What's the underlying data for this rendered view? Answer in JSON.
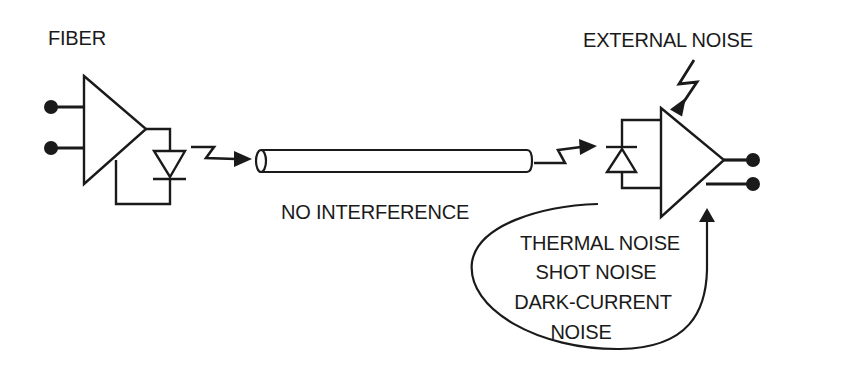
{
  "diagram": {
    "type": "fiber-optic-link-noise",
    "colors": {
      "stroke": "#1a1a1a",
      "background": "#ffffff"
    },
    "labels": {
      "fiber": "FIBER",
      "external_noise": "EXTERNAL NOISE",
      "no_interference": "NO INTERFERENCE",
      "receiver_noise": [
        "THERMAL NOISE",
        "SHOT NOISE",
        "DARK-CURRENT",
        "NOISE"
      ]
    },
    "nodes": [
      {
        "id": "transmitter-amplifier",
        "shape": "triangle"
      },
      {
        "id": "led",
        "shape": "diode"
      },
      {
        "id": "fiber-cable",
        "shape": "cylinder"
      },
      {
        "id": "photodiode",
        "shape": "diode"
      },
      {
        "id": "receiver-amplifier",
        "shape": "triangle"
      }
    ],
    "edges": [
      {
        "from": "led",
        "to": "fiber-cable",
        "style": "lightning-arrow"
      },
      {
        "from": "fiber-cable",
        "to": "photodiode",
        "style": "lightning-arrow"
      },
      {
        "from": "external-noise",
        "to": "receiver-amplifier",
        "style": "lightning-arrow"
      },
      {
        "from": "receiver-noise",
        "to": "receiver-amplifier",
        "style": "curved-arrow"
      }
    ]
  }
}
